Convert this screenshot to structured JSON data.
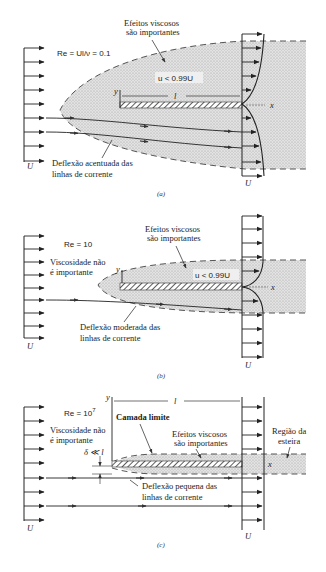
{
  "panels": [
    {
      "id": "a",
      "caption": "(a)",
      "reynolds_label": "Re = Ul/ν = 0.1",
      "viscous_label_line1": "Efeitos viscosos",
      "viscous_label_line2": "são importantes",
      "velocity_condition": "u < 0.99U",
      "plate_length_label": "l",
      "axis_y": "y",
      "axis_x": "x",
      "streamline_label_line1": "Deflexão acentuada das",
      "streamline_label_line2": "linhas de corrente",
      "upstream_velocity": "U",
      "downstream_velocity": "U"
    },
    {
      "id": "b",
      "caption": "(b)",
      "reynolds_label": "Re = 10",
      "viscosity_note_line1": "Viscosidade não",
      "viscosity_note_line2": "é importante",
      "viscous_label_line1": "Efeitos viscosos",
      "viscous_label_line2": "são importantes",
      "velocity_condition": "u < 0.99U",
      "axis_y": "y",
      "axis_x": "x",
      "streamline_label_line1": "Deflexão moderada das",
      "streamline_label_line2": "linhas de corrente",
      "upstream_velocity": "U",
      "downstream_velocity": "U"
    },
    {
      "id": "c",
      "caption": "(c)",
      "reynolds_label": "Re = 10",
      "reynolds_exponent": "7",
      "viscosity_note_line1": "Viscosidade não",
      "viscosity_note_line2": "é importante",
      "boundary_layer_label": "Camada limite",
      "thickness_label": "δ ≪ l",
      "viscous_label_line1": "Efeitos viscosos",
      "viscous_label_line2": "são importantes",
      "wake_label_line1": "Região da",
      "wake_label_line2": "esteira",
      "plate_length_label": "l",
      "axis_y": "y",
      "axis_x": "x",
      "streamline_label_line1": "Deflexão pequena das",
      "streamline_label_line2": "linhas de corrente",
      "upstream_velocity": "U",
      "downstream_velocity": "U"
    }
  ]
}
